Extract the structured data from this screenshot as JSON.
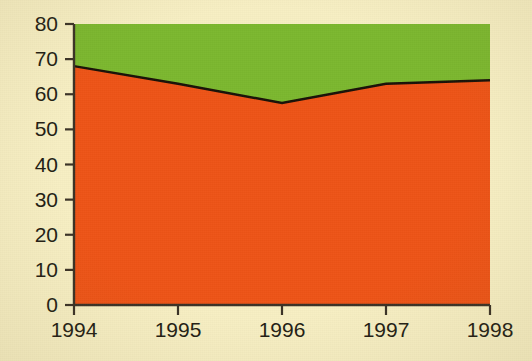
{
  "chart_data": {
    "type": "area",
    "stacked": true,
    "title": "",
    "subtitle": "",
    "xlabel": "",
    "ylabel": "",
    "categories": [
      "1994",
      "1995",
      "1996",
      "1997",
      "1998"
    ],
    "x": [
      1994,
      1995,
      1996,
      1997,
      1998
    ],
    "series": [
      {
        "name": "orange-series",
        "color": "#ee5417",
        "values": [
          68,
          63,
          57.5,
          63,
          64
        ]
      },
      {
        "name": "green-series",
        "color": "#7cb82f",
        "values": [
          12,
          17,
          22.5,
          17,
          16
        ]
      }
    ],
    "stack_total": [
      80,
      80,
      80,
      80,
      80
    ],
    "ylim": [
      0,
      80
    ],
    "ytick_step": 10,
    "yticks": [
      "0",
      "10",
      "20",
      "30",
      "40",
      "50",
      "60",
      "70",
      "80"
    ],
    "xticks": [
      "1994",
      "1995",
      "1996",
      "1997",
      "1998"
    ],
    "grid": false,
    "legend": "none",
    "boundary_line_color": "#1a1208"
  },
  "style": {
    "background": "#f7efc3",
    "axis_color": "#3b3226",
    "text_color": "#231d14",
    "orange": "#ee5417",
    "green": "#7cb82f"
  },
  "plot_geometry": {
    "left": 74,
    "right": 490,
    "top": 24,
    "bottom": 305
  }
}
